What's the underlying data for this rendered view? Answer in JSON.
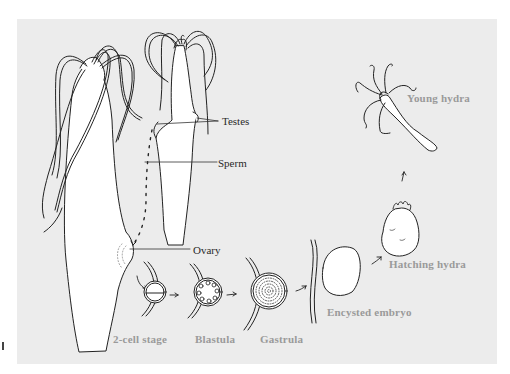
{
  "figure": {
    "background_color": "#ececec",
    "line_color": "#222222",
    "label_colors": {
      "anatomy": "#2a2a2a",
      "stage": "#9a9a9a"
    }
  },
  "labels": {
    "testes": "Testes",
    "sperm": "Sperm",
    "ovary": "Ovary",
    "two_cell_stage": "2-cell stage",
    "blastula": "Blastula",
    "gastrula": "Gastrula",
    "encysted_embryo": "Encysted embryo",
    "hatching_hydra": "Hatching hydra",
    "young_hydra": "Young hydra"
  },
  "stages": [
    {
      "order": 1,
      "name": "2-cell stage"
    },
    {
      "order": 2,
      "name": "Blastula"
    },
    {
      "order": 3,
      "name": "Gastrula"
    },
    {
      "order": 4,
      "name": "Encysted embryo"
    },
    {
      "order": 5,
      "name": "Hatching hydra"
    },
    {
      "order": 6,
      "name": "Young hydra"
    }
  ]
}
